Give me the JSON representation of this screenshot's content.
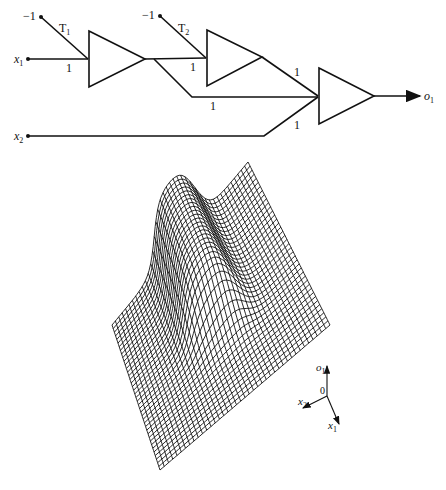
{
  "network": {
    "inputs": [
      {
        "name": "x",
        "sub": "1"
      },
      {
        "name": "x",
        "sub": "2"
      }
    ],
    "bias_labels": [
      "−1",
      "−1"
    ],
    "thresholds": [
      {
        "name": "T",
        "sub": "1"
      },
      {
        "name": "T",
        "sub": "2"
      }
    ],
    "weights": {
      "x1_to_unit1": "1",
      "unit1_to_unit2": "1",
      "unit1_to_output": "1",
      "unit2_to_output": "1",
      "x2_to_output": "1"
    },
    "output": {
      "name": "o",
      "sub": "1"
    },
    "colors": {
      "stroke": "#111111",
      "background": "#ffffff"
    }
  },
  "surface_plot": {
    "axes": {
      "vertical": {
        "name": "o",
        "sub": "1"
      },
      "origin": "0",
      "axis_a": {
        "name": "x",
        "sub": "2"
      },
      "axis_b": {
        "name": "x",
        "sub": "1"
      }
    }
  }
}
